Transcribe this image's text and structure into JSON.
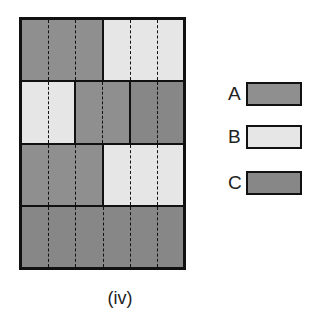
{
  "colors": {
    "A": "#8f8f8f",
    "B": "#e6e6e6",
    "C": "#878787"
  },
  "grid": {
    "columns": 6,
    "rows": [
      [
        {
          "type": "A",
          "start": 0,
          "span": 3
        },
        {
          "type": "B",
          "start": 3,
          "span": 3
        }
      ],
      [
        {
          "type": "B",
          "start": 0,
          "span": 2
        },
        {
          "type": "A",
          "start": 2,
          "span": 2
        },
        {
          "type": "C",
          "start": 4,
          "span": 2
        }
      ],
      [
        {
          "type": "A",
          "start": 0,
          "span": 3
        },
        {
          "type": "B",
          "start": 3,
          "span": 3
        }
      ],
      [
        {
          "type": "C",
          "start": 0,
          "span": 6
        }
      ]
    ]
  },
  "legend": [
    {
      "label": "A",
      "type": "A"
    },
    {
      "label": "B",
      "type": "B"
    },
    {
      "label": "C",
      "type": "C"
    }
  ],
  "caption": "(iv)"
}
